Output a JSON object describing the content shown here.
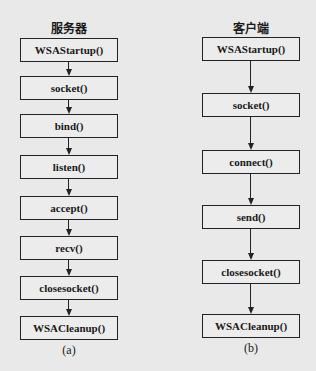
{
  "diagram": {
    "server": {
      "title": "服务器",
      "caption": "(a)",
      "steps": [
        "WSAStartup()",
        "socket()",
        "bind()",
        "listen()",
        "accept()",
        "recv()",
        "closesocket()",
        "WSACleanup()"
      ]
    },
    "client": {
      "title": "客户端",
      "caption": "(b)",
      "steps": [
        "WSAStartup()",
        "socket()",
        "connect()",
        "send()",
        "closesocket()",
        "WSACleanup()"
      ]
    },
    "colors": {
      "background": "#e9e9e9",
      "stroke": "#222222"
    }
  }
}
